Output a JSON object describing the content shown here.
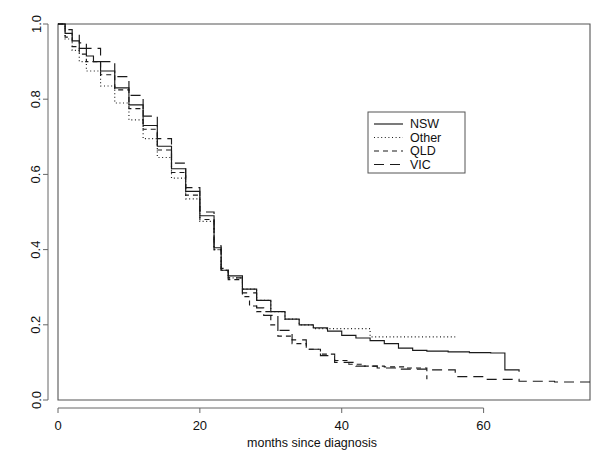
{
  "chart_data": {
    "type": "line",
    "title": "",
    "xlabel": "months since diagnosis",
    "ylabel": "",
    "xlim": [
      0,
      75
    ],
    "ylim": [
      0.0,
      1.0
    ],
    "xticks": [
      0,
      20,
      40,
      60
    ],
    "xtick_labels": [
      "0",
      "20",
      "40",
      "60"
    ],
    "yticks": [
      0.0,
      0.2,
      0.4,
      0.6,
      0.8,
      1.0
    ],
    "ytick_labels": [
      "0.0",
      "0.2",
      "0.4",
      "0.6",
      "0.8",
      "1.0"
    ],
    "grid": false,
    "legend_position": "upper right",
    "step": true,
    "series": [
      {
        "name": "NSW",
        "dash": "none",
        "color": "#1a1a1a",
        "x": [
          0,
          1,
          2,
          3,
          4,
          5,
          6,
          8,
          10,
          12,
          14,
          16,
          18,
          20,
          22,
          23,
          24,
          26,
          28,
          30,
          32,
          34,
          36,
          38,
          40,
          42,
          44,
          46,
          48,
          50,
          52,
          55,
          58,
          61,
          63,
          65
        ],
        "y": [
          1.0,
          0.975,
          0.955,
          0.935,
          0.915,
          0.9,
          0.875,
          0.83,
          0.785,
          0.73,
          0.675,
          0.615,
          0.555,
          0.49,
          0.405,
          0.345,
          0.33,
          0.295,
          0.265,
          0.235,
          0.215,
          0.2,
          0.192,
          0.183,
          0.172,
          0.165,
          0.158,
          0.15,
          0.138,
          0.132,
          0.13,
          0.128,
          0.126,
          0.125,
          0.08,
          0.075
        ]
      },
      {
        "name": "Other",
        "dash": "dotted",
        "color": "#1a1a1a",
        "x": [
          0,
          1,
          2,
          3,
          4,
          6,
          8,
          10,
          12,
          14,
          16,
          18,
          20,
          22,
          23,
          24,
          26,
          28,
          30,
          32,
          34,
          36,
          38,
          42,
          44,
          48,
          52,
          56
        ],
        "y": [
          1.0,
          0.96,
          0.93,
          0.9,
          0.875,
          0.835,
          0.79,
          0.745,
          0.695,
          0.645,
          0.59,
          0.535,
          0.475,
          0.4,
          0.345,
          0.325,
          0.295,
          0.265,
          0.235,
          0.215,
          0.2,
          0.19,
          0.19,
          0.19,
          0.168,
          0.168,
          0.168,
          0.168
        ]
      },
      {
        "name": "QLD",
        "dash": "dashed-short",
        "color": "#1a1a1a",
        "x": [
          0,
          1,
          2,
          3,
          4,
          6,
          8,
          10,
          12,
          14,
          16,
          18,
          20,
          22,
          23,
          24,
          26,
          27,
          28,
          30,
          31,
          33,
          35,
          37,
          39,
          41,
          43,
          46,
          49,
          52
        ],
        "y": [
          1.0,
          0.965,
          0.94,
          0.92,
          0.9,
          0.865,
          0.825,
          0.775,
          0.72,
          0.665,
          0.605,
          0.545,
          0.48,
          0.4,
          0.345,
          0.32,
          0.275,
          0.25,
          0.235,
          0.2,
          0.17,
          0.15,
          0.135,
          0.122,
          0.105,
          0.095,
          0.09,
          0.088,
          0.085,
          0.055
        ]
      },
      {
        "name": "VIC",
        "dash": "dashed-long",
        "color": "#1a1a1a",
        "x": [
          0,
          1,
          2,
          3,
          4,
          6,
          8,
          10,
          12,
          14,
          16,
          18,
          20,
          22,
          23,
          24,
          26,
          28,
          29,
          31,
          33,
          35,
          37,
          39,
          42,
          45,
          48,
          52,
          56,
          60,
          65,
          70,
          75
        ],
        "y": [
          1.0,
          0.985,
          0.97,
          0.95,
          0.935,
          0.9,
          0.86,
          0.81,
          0.755,
          0.695,
          0.63,
          0.565,
          0.5,
          0.41,
          0.35,
          0.325,
          0.285,
          0.245,
          0.225,
          0.185,
          0.16,
          0.135,
          0.118,
          0.1,
          0.09,
          0.085,
          0.082,
          0.08,
          0.062,
          0.055,
          0.05,
          0.048,
          0.048
        ]
      }
    ]
  },
  "legend": {
    "entries": [
      {
        "label": "NSW"
      },
      {
        "label": "Other"
      },
      {
        "label": "QLD"
      },
      {
        "label": "VIC"
      }
    ]
  },
  "axes": {
    "x_title": "months since diagnosis"
  }
}
